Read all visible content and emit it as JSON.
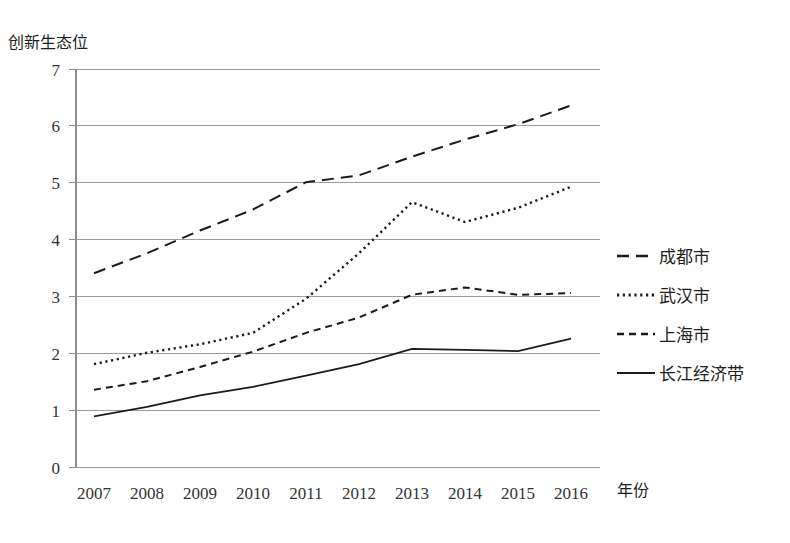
{
  "chart_data": {
    "type": "line",
    "title": "",
    "xlabel": "年份",
    "ylabel": "创新生态位",
    "categories": [
      "2007",
      "2008",
      "2009",
      "2010",
      "2011",
      "2012",
      "2013",
      "2014",
      "2015",
      "2016"
    ],
    "x": [
      2007,
      2008,
      2009,
      2010,
      2011,
      2012,
      2013,
      2014,
      2015,
      2016
    ],
    "xlim": [
      2007,
      2016
    ],
    "ylim": [
      0,
      7
    ],
    "yticks": [
      "0",
      "1",
      "2",
      "3",
      "4",
      "5",
      "6",
      "7"
    ],
    "ytick_values": [
      0,
      1,
      2,
      3,
      4,
      5,
      6,
      7
    ],
    "grid": "horizontal",
    "legend_position": "right",
    "series": [
      {
        "name": "成都市",
        "style": "long-dash",
        "dash": "12,7",
        "width": 2.0,
        "color": "#1b1b1b",
        "values": [
          3.4,
          3.75,
          4.15,
          4.52,
          5.0,
          5.12,
          5.45,
          5.75,
          6.02,
          6.35
        ]
      },
      {
        "name": "武汉市",
        "style": "dotted",
        "dash": "2.2,3.6",
        "width": 2.4,
        "color": "#1b1b1b",
        "values": [
          1.8,
          2.0,
          2.15,
          2.35,
          2.95,
          3.75,
          4.65,
          4.3,
          4.55,
          4.92
        ]
      },
      {
        "name": "上海市",
        "style": "short-dash",
        "dash": "7,5",
        "width": 2.0,
        "color": "#1b1b1b",
        "values": [
          1.35,
          1.5,
          1.75,
          2.02,
          2.35,
          2.62,
          3.02,
          3.15,
          3.02,
          3.05
        ]
      },
      {
        "name": "长江经济带",
        "style": "solid",
        "dash": "",
        "width": 1.8,
        "color": "#1b1b1b",
        "values": [
          0.88,
          1.05,
          1.25,
          1.4,
          1.6,
          1.8,
          2.07,
          2.05,
          2.03,
          2.25
        ]
      }
    ]
  },
  "legend": {
    "entries": [
      {
        "label": "成都市"
      },
      {
        "label": "武汉市"
      },
      {
        "label": "上海市"
      },
      {
        "label": "长江经济带"
      }
    ]
  },
  "colors": {
    "ink": "#1b1b1b",
    "grid": "#9b9b9b",
    "axis": "#8d8d8d",
    "background": "#ffffff"
  }
}
